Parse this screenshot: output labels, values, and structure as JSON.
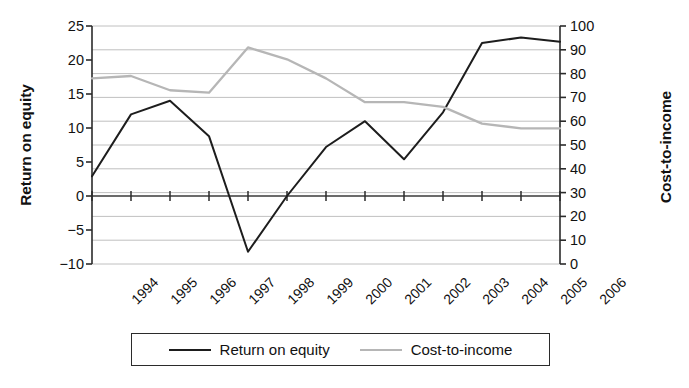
{
  "chart_data": {
    "type": "line",
    "title": "",
    "xlabel": "",
    "categories": [
      "1994",
      "1995",
      "1996",
      "1997",
      "1998",
      "1999",
      "2000",
      "2001",
      "2002",
      "2003",
      "2004",
      "2005",
      "2006"
    ],
    "grid": true,
    "legend_position": "bottom",
    "series": [
      {
        "name": "Return on equity",
        "axis": "left",
        "color": "#1d1d1d",
        "values": [
          2.9,
          12.0,
          14.0,
          8.8,
          -8.2,
          0.0,
          7.2,
          11.0,
          5.4,
          12.3,
          22.5,
          23.3,
          22.7
        ]
      },
      {
        "name": "Cost-to-income",
        "axis": "right",
        "color": "#b6b6b6",
        "values": [
          78,
          79,
          73,
          72,
          91,
          86,
          78,
          68,
          68,
          66,
          59,
          57,
          57
        ]
      }
    ],
    "left_axis": {
      "label": "Return on equity",
      "ticks": [
        25,
        20,
        15,
        10,
        5,
        0,
        -5,
        -10
      ],
      "tick_labels": [
        "25",
        "20",
        "15",
        "10",
        "5",
        "0",
        "−5",
        "−10"
      ],
      "ylim": [
        -10,
        25
      ]
    },
    "right_axis": {
      "label": "Cost-to-income",
      "ticks": [
        100,
        90,
        80,
        70,
        60,
        50,
        40,
        30,
        20,
        10,
        0
      ],
      "tick_labels": [
        "100",
        "90",
        "80",
        "70",
        "60",
        "50",
        "40",
        "30",
        "20",
        "10",
        "0"
      ],
      "ylim": [
        0,
        100
      ]
    },
    "legend": {
      "entries": [
        {
          "label": "Return on equity",
          "color": "#1d1d1d"
        },
        {
          "label": "Cost-to-income",
          "color": "#b6b6b6"
        }
      ]
    }
  }
}
